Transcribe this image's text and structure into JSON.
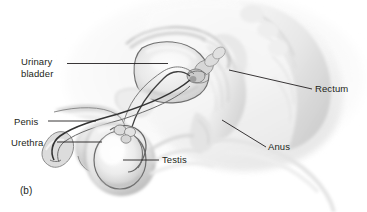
{
  "figure": {
    "caption": "(b)",
    "background_color": "#ffffff",
    "text_color": "#231f20",
    "leader_line_color": "#231f20"
  },
  "labels": {
    "urinary_bladder": "Urinary\nbladder",
    "penis": "Penis",
    "urethra": "Urethra",
    "testis": "Testis",
    "rectum": "Rectum",
    "anus": "Anus"
  },
  "illustration": {
    "style": "grayscale-anatomical-airbrush",
    "palette": {
      "lightest": "#fdfdfd",
      "light": "#f0f0f0",
      "mid_light": "#e2e2e2",
      "mid": "#cfcfcf",
      "mid_dark": "#b4b4b4",
      "dark": "#8f8f8f",
      "darkest": "#5a5a5a",
      "outline": "#3a3a3a"
    },
    "structures": [
      "sacrum",
      "rectum",
      "urinary bladder",
      "prostate gland",
      "seminal vesicle",
      "pubic bone",
      "penis shaft",
      "urethra",
      "glans penis",
      "testis",
      "epididymis",
      "scrotum",
      "ductus deferens",
      "anus"
    ]
  }
}
